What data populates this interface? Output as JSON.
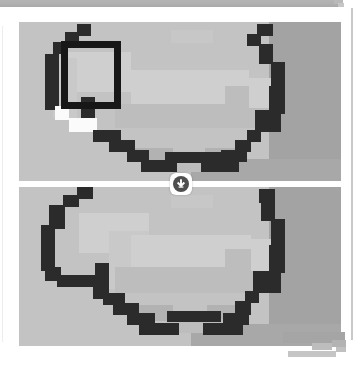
{
  "window": {
    "title": "Image Comparison Viewer",
    "background_color": "#ffffff",
    "toolbar_color": "#b0b0b0"
  },
  "toolbar": {
    "label": "toolbar strip"
  },
  "viewer": {
    "label": "Stacked image comparison",
    "panel_count": 2,
    "panels": [
      {
        "id": "panel-top",
        "label": "Top image panel",
        "role": "original pixelated grayscale mask",
        "background_color": "#c3c3c3",
        "has_annotation": true
      },
      {
        "id": "panel-bottom",
        "label": "Bottom image panel",
        "role": "comparison pixelated grayscale mask",
        "background_color": "#c3c3c3",
        "has_annotation": false
      }
    ]
  },
  "annotation": {
    "name": "selection rectangle",
    "shape": "rectangle",
    "stroke_color": "#171717",
    "stroke_width_px": 7,
    "x": 42,
    "y": 19,
    "width": 60,
    "height": 68
  },
  "divider_badge": {
    "name": "scroll-down badge",
    "icon": "arrow-down-circle-icon",
    "glyph": "↓",
    "badge_color": "#ffffff",
    "circle_color": "#4e4e4e",
    "tooltip": "Scroll to next image"
  },
  "decoration": {
    "name": "bottom-right stepped edge",
    "color": "#a9a9a9"
  },
  "palette": {
    "field": "#c3c3c3",
    "field_dark": "#a3a3a3",
    "blob_light": "#c9c9c9",
    "blob_lighter": "#cfcfcf",
    "outline_dark": "#2b2b2b",
    "highlight_white": "#fbfbfb",
    "rule": "#c9c9c9"
  }
}
